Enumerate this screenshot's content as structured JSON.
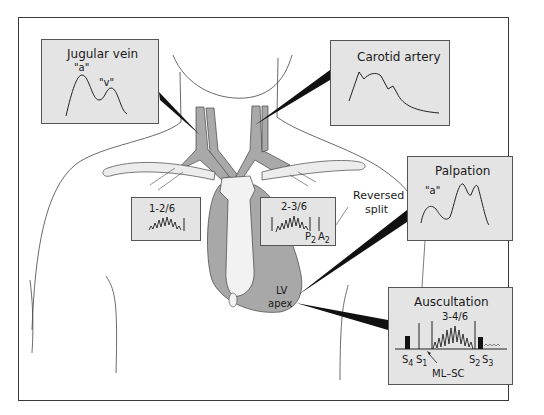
{
  "panels": {
    "jugular": {
      "title": "Jugular vein",
      "wave_labels": [
        "\"a\"",
        "\"v\""
      ]
    },
    "carotid": {
      "title": "Carotid artery"
    },
    "palpation": {
      "title": "Palpation",
      "wave_labels": [
        "\"a\""
      ]
    },
    "auscultation": {
      "title": "Auscultation",
      "grade": "3-4/6",
      "sounds": [
        "S4",
        "S1",
        "S2",
        "S3"
      ],
      "sound_parts": {
        "s4": [
          "S",
          "4"
        ],
        "s1": [
          "S",
          "1"
        ],
        "s2": [
          "S",
          "2"
        ],
        "s3": [
          "S",
          "3"
        ]
      },
      "annotation": "ML–SC"
    }
  },
  "murmurs": {
    "left": {
      "grade": "1-2/6"
    },
    "right": {
      "grade": "2-3/6",
      "p2": [
        "P",
        "2"
      ],
      "a2": [
        "A",
        "2"
      ]
    }
  },
  "annotations": {
    "reversed_split_line1": "Reversed",
    "reversed_split_line2": "split",
    "lv_apex_line1": "LV",
    "lv_apex_line2": "apex"
  },
  "colors": {
    "panel_bg": "#e4e4e4",
    "vessel_gray": "#a9a9a9",
    "heart_gray": "#a8a8a8",
    "outline": "#3a3a3a"
  }
}
